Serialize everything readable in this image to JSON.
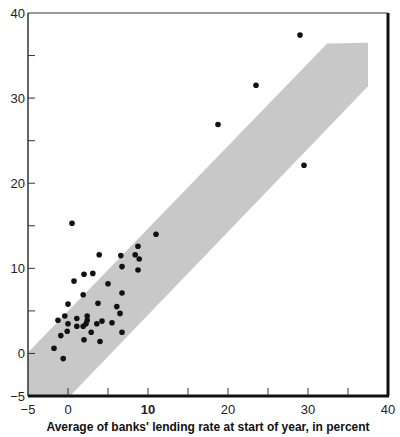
{
  "chart_data": {
    "type": "scatter",
    "title": "",
    "xlabel": "Average of banks' lending rate at start of year, in percent",
    "ylabel": "",
    "xlim": [
      -5,
      40
    ],
    "ylim": [
      -5,
      40
    ],
    "x_ticks": [
      -5,
      0,
      10,
      20,
      30,
      40
    ],
    "x_tick_labels": [
      "−5",
      "0",
      "10",
      "20",
      "30",
      "40"
    ],
    "x_minor_ticks": [
      5,
      15,
      25,
      35
    ],
    "y_ticks": [
      -5,
      0,
      10,
      20,
      30,
      40
    ],
    "y_tick_labels": [
      "−5",
      "0",
      "10",
      "20",
      "30",
      "40"
    ],
    "y_minor_ticks": [
      5,
      15,
      25,
      35
    ],
    "grid": false,
    "legend": null,
    "colors": {
      "points": "#111111",
      "band": "#c8c8c8",
      "axis": "#111111"
    },
    "band": {
      "description": "shaded band around 45-degree line",
      "polygon": [
        [
          -5,
          0.1
        ],
        [
          32.4,
          36.4
        ],
        [
          37.5,
          36.5
        ],
        [
          37.5,
          31.4
        ],
        [
          0.25,
          -5
        ],
        [
          -5,
          -5
        ]
      ]
    },
    "series": [
      {
        "name": "observations",
        "points": [
          [
            29.0,
            37.4
          ],
          [
            23.5,
            31.5
          ],
          [
            18.75,
            26.9
          ],
          [
            29.5,
            22.1
          ],
          [
            0.5,
            15.3
          ],
          [
            11.0,
            14.0
          ],
          [
            8.75,
            12.6
          ],
          [
            3.9,
            11.6
          ],
          [
            6.6,
            11.5
          ],
          [
            8.4,
            11.6
          ],
          [
            8.9,
            11.1
          ],
          [
            6.75,
            10.2
          ],
          [
            8.75,
            9.8
          ],
          [
            3.1,
            9.4
          ],
          [
            2.0,
            9.3
          ],
          [
            0.75,
            8.5
          ],
          [
            5.0,
            8.2
          ],
          [
            1.9,
            6.9
          ],
          [
            6.75,
            7.1
          ],
          [
            0.0,
            5.8
          ],
          [
            3.75,
            5.9
          ],
          [
            6.1,
            5.5
          ],
          [
            6.5,
            4.7
          ],
          [
            -0.4,
            4.4
          ],
          [
            -1.25,
            3.9
          ],
          [
            1.1,
            4.1
          ],
          [
            2.4,
            4.4
          ],
          [
            2.4,
            3.9
          ],
          [
            0.0,
            3.5
          ],
          [
            1.1,
            3.2
          ],
          [
            1.9,
            3.2
          ],
          [
            2.25,
            3.5
          ],
          [
            3.6,
            3.5
          ],
          [
            4.25,
            3.8
          ],
          [
            5.5,
            3.6
          ],
          [
            -0.1,
            2.6
          ],
          [
            -0.9,
            2.1
          ],
          [
            2.9,
            2.5
          ],
          [
            6.75,
            2.5
          ],
          [
            2.0,
            1.6
          ],
          [
            4.0,
            1.4
          ],
          [
            -1.75,
            0.6
          ],
          [
            -0.6,
            -0.6
          ]
        ]
      }
    ]
  }
}
